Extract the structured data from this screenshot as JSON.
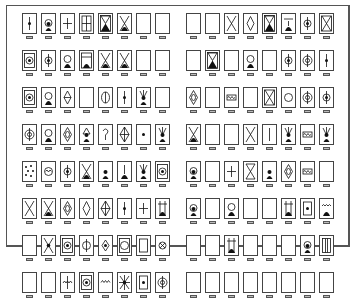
{
  "panels": [
    {
      "name": "left-sheet",
      "rows": [
        [
          "dot-line",
          "hood-figure",
          "cross",
          "window-grid",
          "hourglass-figure",
          "x-figure",
          "blank",
          "blank"
        ],
        [
          "target-box",
          "dot-circle",
          "circle-mound",
          "window-figure",
          "x-figure",
          "x-mound",
          "blank",
          "blank"
        ],
        [
          "target-box",
          "circle-mound",
          "star-diamond",
          "blank",
          "oval-figure",
          "dot-line",
          "pawn-rays",
          "blank"
        ],
        [
          "circle-target",
          "circle-mound",
          "diamond-oval",
          "triangle-figure",
          "question",
          "lattice",
          "dot",
          "pawn-rays"
        ],
        [
          "dots-scatter",
          "circle-wave",
          "dot-circle",
          "x-figure",
          "pawn",
          "mound",
          "pawn-rays",
          "target-box"
        ],
        [
          "x-lines",
          "x-figure",
          "diamond-oval",
          "diamond",
          "lattice",
          "dot-line",
          "cross",
          "window-mound"
        ],
        [
          "blank",
          "x-dot",
          "target-box",
          "circle-line",
          "dot-diamond",
          "circle-box",
          "inner-box",
          "x-circle"
        ],
        [
          "blank",
          "blank",
          "wave-line",
          "target-box",
          "wave",
          "star-burst",
          "dot-box",
          "circle-target"
        ]
      ]
    },
    {
      "name": "right-sheet",
      "rows": [
        [
          "blank",
          "blank",
          "x-lines",
          "diamond",
          "hourglass-figure",
          "line-mound",
          "dot-circle",
          "x-box"
        ],
        [
          "blank",
          "hourglass-figure",
          "blank",
          "circle-mound",
          "blank",
          "dot-circle",
          "circle-target",
          "dot-line"
        ],
        [
          "diamond-oval",
          "blank",
          "wave-box",
          "blank",
          "x-box",
          "circle",
          "circle-target",
          "dot-circle"
        ],
        [
          "x-mound",
          "blank",
          "blank",
          "x-lines",
          "line",
          "pawn-rays",
          "wave-box",
          "pawn-rays"
        ],
        [
          "hood-figure",
          "blank",
          "cross",
          "hourglass",
          "pawn",
          "diamond-oval",
          "wave-box",
          "blank"
        ],
        [
          "hood-figure",
          "blank",
          "circle-mound",
          "blank",
          "blank",
          "window-mound",
          "dot-box",
          "wave-mound"
        ],
        [
          "blank",
          "blank",
          "window-mound",
          "blank",
          "blank",
          "blank",
          "hood-figure",
          "window-bars"
        ],
        [
          "blank",
          "blank",
          "blank",
          "blank",
          "blank",
          "blank",
          "blank",
          "blank"
        ]
      ]
    }
  ],
  "colors": {
    "ink": "#111111",
    "frame": "#555555",
    "tab": "#bbbbbb"
  }
}
